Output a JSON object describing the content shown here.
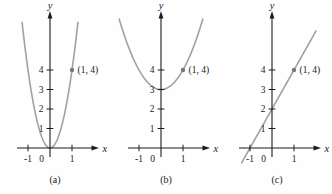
{
  "figure": {
    "background": "#fefefe",
    "colors": {
      "axis": "#1b1b1b",
      "text": "#1b1b1b",
      "curve": "#9aa5a2",
      "point": "#6f7d7a"
    },
    "axis": {
      "x_label": "x",
      "y_label": "y"
    }
  },
  "chart_data": [
    {
      "id": "a",
      "type": "line",
      "label": "(a)",
      "curve": {
        "kind": "polynomial",
        "coeffs": [
          0,
          0,
          4
        ],
        "equation": "y = 4x^2",
        "x_range": [
          -1.27,
          1.27
        ]
      },
      "point": {
        "x": 1,
        "y": 4,
        "label": "(1, 4)"
      },
      "x_ticks": [
        {
          "value": -1,
          "label": "-1"
        },
        {
          "value": 1,
          "label": "1"
        }
      ],
      "origin_label": "0",
      "y_ticks": [
        {
          "value": 1,
          "label": "1"
        },
        {
          "value": 2,
          "label": "2"
        },
        {
          "value": 3,
          "label": "3"
        },
        {
          "value": 4,
          "label": "4"
        }
      ],
      "xlim": [
        -1.5,
        2.1
      ],
      "ylim": [
        -0.9,
        7.0
      ],
      "grid": false
    },
    {
      "id": "b",
      "type": "line",
      "label": "(b)",
      "curve": {
        "kind": "polynomial",
        "coeffs": [
          3,
          0,
          1
        ],
        "equation": "y = x^2 + 3",
        "x_range": [
          -1.9,
          1.9
        ]
      },
      "point": {
        "x": 1,
        "y": 4,
        "label": "(1, 4)"
      },
      "x_ticks": [
        {
          "value": -1,
          "label": "-1"
        },
        {
          "value": 1,
          "label": "1"
        }
      ],
      "origin_label": "0",
      "y_ticks": [
        {
          "value": 1,
          "label": "1"
        },
        {
          "value": 2,
          "label": "2"
        },
        {
          "value": 3,
          "label": "3"
        },
        {
          "value": 4,
          "label": "4"
        }
      ],
      "xlim": [
        -1.5,
        2.1
      ],
      "ylim": [
        -0.9,
        7.0
      ],
      "grid": false
    },
    {
      "id": "c",
      "type": "line",
      "label": "(c)",
      "curve": {
        "kind": "polynomial",
        "coeffs": [
          2,
          2
        ],
        "equation": "y = 2x + 2",
        "x_range": [
          -1.38,
          2.0
        ]
      },
      "point": {
        "x": 1,
        "y": 4,
        "label": "(1, 4)"
      },
      "x_ticks": [
        {
          "value": -1,
          "label": "-1"
        },
        {
          "value": 1,
          "label": "1"
        }
      ],
      "origin_label": "0",
      "y_ticks": [
        {
          "value": 1,
          "label": "1"
        },
        {
          "value": 2,
          "label": "2"
        },
        {
          "value": 3,
          "label": "3"
        },
        {
          "value": 4,
          "label": "4"
        }
      ],
      "xlim": [
        -1.5,
        2.1
      ],
      "ylim": [
        -0.9,
        7.0
      ],
      "grid": false
    }
  ]
}
